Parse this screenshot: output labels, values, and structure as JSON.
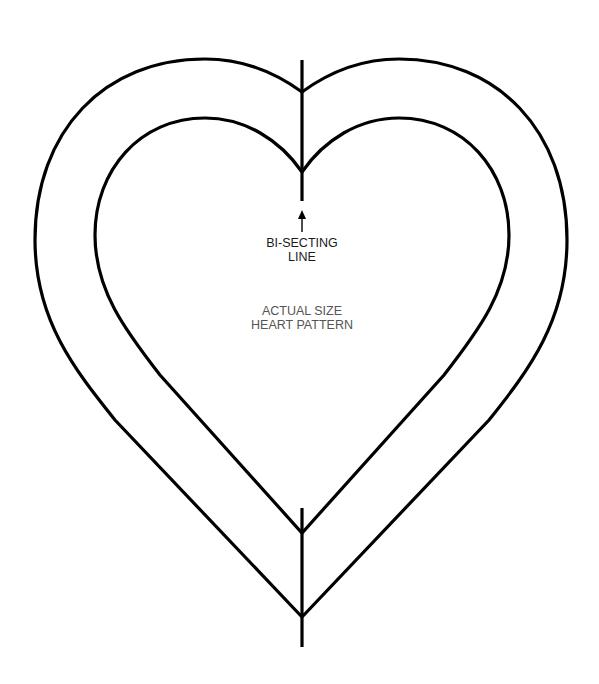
{
  "diagram": {
    "type": "sewing-pattern",
    "shape": "heart",
    "labels": {
      "bisecting_line_1": "BI-SECTING",
      "bisecting_line_2": "LINE",
      "pattern_title_1": "ACTUAL SIZE",
      "pattern_title_2": "HEART PATTERN"
    },
    "elements": [
      {
        "name": "outer-heart-outline",
        "kind": "closed-path"
      },
      {
        "name": "inner-heart-outline",
        "kind": "closed-path"
      },
      {
        "name": "bisecting-line-top",
        "kind": "line"
      },
      {
        "name": "bisecting-line-bottom",
        "kind": "line"
      },
      {
        "name": "arrow-up-icon",
        "kind": "arrow",
        "points_to": "bisecting-line-top"
      }
    ],
    "colors": {
      "stroke": "#000000",
      "label": "#1a1a1a",
      "title": "#555555",
      "background": "#ffffff"
    }
  }
}
